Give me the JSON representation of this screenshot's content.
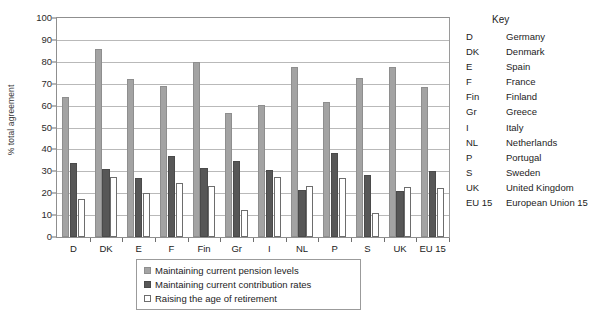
{
  "chart_data": {
    "type": "bar",
    "title": "",
    "xlabel": "",
    "ylabel": "% total agreement",
    "ylim": [
      0,
      100
    ],
    "ytick_step": 10,
    "yticks": [
      0,
      10,
      20,
      30,
      40,
      50,
      60,
      70,
      80,
      90,
      100
    ],
    "grid": true,
    "legend_position": "bottom",
    "categories": [
      "D",
      "DK",
      "E",
      "F",
      "Fin",
      "Gr",
      "I",
      "NL",
      "P",
      "S",
      "UK",
      "EU 15"
    ],
    "series": [
      {
        "name": "Maintaining current pension levels",
        "color": "#a3a3a3",
        "values": [
          64,
          86,
          72,
          69,
          80,
          56.5,
          60.5,
          77.5,
          61.5,
          72.5,
          77.5,
          68.5
        ]
      },
      {
        "name": "Maintaining current contribution rates",
        "color": "#575757",
        "values": [
          34,
          31,
          27,
          37,
          31.5,
          34.5,
          30.5,
          21.5,
          38.5,
          28.5,
          21,
          30
        ]
      },
      {
        "name": "Raising the age of retirement",
        "color": "#ffffff",
        "values": [
          17.5,
          27.5,
          20,
          24.5,
          23.5,
          12.5,
          27.5,
          23.5,
          27,
          11,
          23,
          22.5
        ]
      }
    ]
  },
  "legend": {
    "items": [
      "Maintaining current pension levels",
      "Maintaining current contribution rates",
      "Raising the age of retirement"
    ]
  },
  "key": {
    "title": "Key",
    "rows": [
      {
        "code": "D",
        "name": "Germany"
      },
      {
        "code": "DK",
        "name": "Denmark"
      },
      {
        "code": "E",
        "name": "Spain"
      },
      {
        "code": "F",
        "name": "France"
      },
      {
        "code": "Fin",
        "name": "Finland"
      },
      {
        "code": "Gr",
        "name": "Greece"
      },
      {
        "code": "I",
        "name": "Italy"
      },
      {
        "code": "NL",
        "name": "Netherlands"
      },
      {
        "code": "P",
        "name": "Portugal"
      },
      {
        "code": "S",
        "name": "Sweden"
      },
      {
        "code": "UK",
        "name": "United Kingdom"
      },
      {
        "code": "EU 15",
        "name": "European Union 15"
      }
    ]
  }
}
